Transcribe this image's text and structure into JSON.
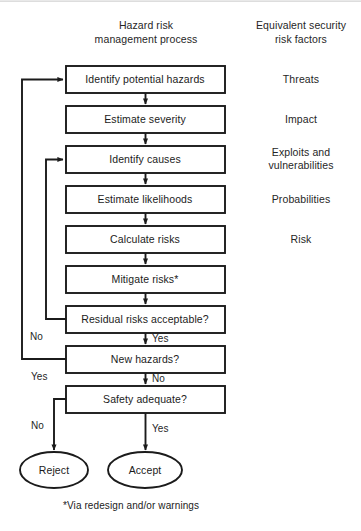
{
  "figure": {
    "headers": {
      "left": "Hazard risk\nmanagement process",
      "left_line1": "Hazard risk",
      "left_line2": "management process",
      "right": "Equivalent security\nrisk factors",
      "right_line1": "Equivalent security",
      "right_line2": "risk factors"
    },
    "footnote": "*Via redesign and/or warnings",
    "colors": {
      "stroke": "#1b1b1b",
      "fill": "#ffffff",
      "text": "#1b1b1b",
      "background": "#ffffff",
      "top_rule": "#e9e9e9"
    }
  },
  "process_steps": [
    {
      "id": "identify-potential-hazards",
      "label": "Identify potential hazards",
      "shape": "rect"
    },
    {
      "id": "estimate-severity",
      "label": "Estimate severity",
      "shape": "rect"
    },
    {
      "id": "identify-causes",
      "label": "Identify causes",
      "shape": "rect"
    },
    {
      "id": "estimate-likelihoods",
      "label": "Estimate likelihoods",
      "shape": "rect"
    },
    {
      "id": "calculate-risks",
      "label": "Calculate risks",
      "shape": "rect"
    },
    {
      "id": "mitigate-risks",
      "label": "Mitigate risks*",
      "shape": "rect"
    },
    {
      "id": "residual-risks-acceptable",
      "label": "Residual risks acceptable?",
      "shape": "rect"
    },
    {
      "id": "new-hazards",
      "label": "New hazards?",
      "shape": "rect"
    },
    {
      "id": "safety-adequate",
      "label": "Safety adequate?",
      "shape": "rect"
    }
  ],
  "terminals": [
    {
      "id": "reject",
      "label": "Reject",
      "shape": "ellipse"
    },
    {
      "id": "accept",
      "label": "Accept",
      "shape": "ellipse"
    }
  ],
  "risk_factors": [
    {
      "id": "threats",
      "label": "Threats",
      "aligns_to": "identify-potential-hazards"
    },
    {
      "id": "impact",
      "label": "Impact",
      "aligns_to": "estimate-severity"
    },
    {
      "id": "exploits",
      "label": "Exploits and",
      "aligns_to": "identify-causes"
    },
    {
      "id": "exploits2",
      "label": "vulnerabilities",
      "aligns_to": "identify-causes"
    },
    {
      "id": "probabilities",
      "label": "Probabilities",
      "aligns_to": "estimate-likelihoods"
    },
    {
      "id": "risk",
      "label": "Risk",
      "aligns_to": "calculate-risks"
    }
  ],
  "edge_labels": [
    {
      "id": "residual-no",
      "label": "No",
      "from": "residual-risks-acceptable",
      "to": "identify-causes"
    },
    {
      "id": "residual-yes",
      "label": "Yes",
      "from": "residual-risks-acceptable",
      "to": "new-hazards"
    },
    {
      "id": "hazards-yes",
      "label": "Yes",
      "from": "new-hazards",
      "to": "identify-potential-hazards"
    },
    {
      "id": "hazards-no",
      "label": "No",
      "from": "new-hazards",
      "to": "safety-adequate"
    },
    {
      "id": "safety-no",
      "label": "No",
      "from": "safety-adequate",
      "to": "reject"
    },
    {
      "id": "safety-yes",
      "label": "Yes",
      "from": "safety-adequate",
      "to": "accept"
    }
  ]
}
